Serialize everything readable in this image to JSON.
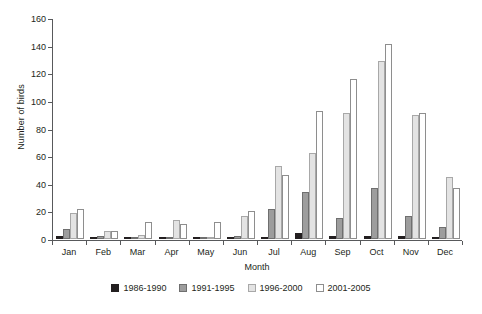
{
  "chart_data": {
    "type": "bar",
    "title": "",
    "subtitle": "",
    "xlabel": "Month",
    "ylabel": "Number of birds",
    "ylim": [
      0,
      160
    ],
    "ytick_step": 20,
    "yticks": [
      0,
      20,
      40,
      60,
      80,
      100,
      120,
      140,
      160
    ],
    "grid": false,
    "legend_position": "bottom-center",
    "categories": [
      "Jan",
      "Feb",
      "Mar",
      "Apr",
      "May",
      "Jun",
      "Jul",
      "Aug",
      "Sep",
      "Oct",
      "Nov",
      "Dec"
    ],
    "series": [
      {
        "name": "1986-1990",
        "color": "#231f20",
        "values": [
          2,
          1,
          0,
          0,
          0,
          0,
          1,
          4,
          2,
          2,
          2,
          1
        ]
      },
      {
        "name": "1991-1995",
        "color": "#9d9d9d",
        "values": [
          7,
          2,
          0,
          1,
          0,
          2,
          22,
          34,
          15,
          37,
          17,
          9
        ]
      },
      {
        "name": "1996-2000",
        "color": "#e3e3e3",
        "values": [
          19,
          6,
          3,
          14,
          0,
          17,
          53,
          62,
          91,
          129,
          90,
          45
        ]
      },
      {
        "name": "2001-2005",
        "color": "#ffffff",
        "values": [
          22,
          6,
          12,
          11,
          12,
          20,
          46,
          93,
          116,
          141,
          91,
          37
        ]
      }
    ]
  }
}
